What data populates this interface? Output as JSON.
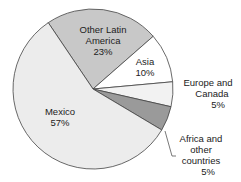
{
  "chart_data": {
    "type": "pie",
    "title": "",
    "center": [
      93,
      89
    ],
    "radius": 80,
    "slices": [
      {
        "label": "Mexico",
        "value": 57,
        "color": "#ececec",
        "label_lines": [
          "Mexico",
          "57%"
        ]
      },
      {
        "label": "Other Latin America",
        "value": 23,
        "color": "#c8c8c8",
        "label_lines": [
          "Other Latin",
          "America",
          "23%"
        ]
      },
      {
        "label": "Asia",
        "value": 10,
        "color": "#ffffff",
        "label_lines": [
          "Asia",
          "10%"
        ]
      },
      {
        "label": "Europe and Canada",
        "value": 5,
        "color": "#f2f2f2",
        "label_lines": [
          "Europe and",
          "Canada",
          "5%"
        ]
      },
      {
        "label": "Africa and other countries",
        "value": 5,
        "color": "#9a9a9a",
        "label_lines": [
          "Africa and",
          "other",
          "countries",
          "5%"
        ]
      }
    ],
    "labels": {
      "mexico": "Mexico\n57%",
      "other_latin_america": "Other Latin\nAmerica\n23%",
      "asia": "Asia\n10%",
      "europe_canada": "Europe and\nCanada\n5%",
      "africa_other": "Africa and\nother\ncountries\n5%"
    }
  }
}
